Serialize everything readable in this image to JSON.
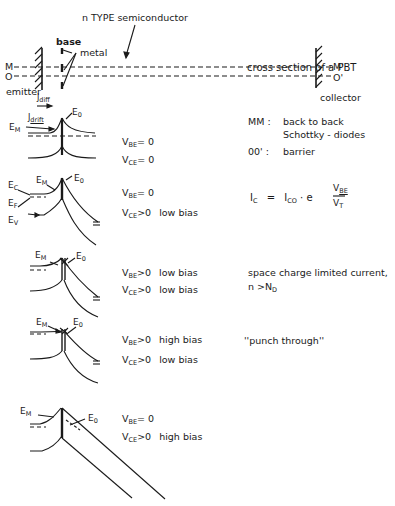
{
  "cross_section": {
    "n_type_label": "n TYPE  semiconductor",
    "base_label": "base",
    "metal_label": "metal",
    "M_label": "M",
    "O_label": "O",
    "M_prime_label": "M'",
    "O_prime_label": "O'",
    "emitter_label": "emitter",
    "collector_label": "collector",
    "j_diff_label": "J",
    "j_diff_sub": "diff",
    "j_drift_label": "J",
    "j_drift_sub": "drift",
    "caption": "cross section of a PBT"
  },
  "legend": {
    "mm_key": "MM  :",
    "mm_text_1": "back to back",
    "mm_text_2": "Schottky - diodes",
    "oo_key": "00' :",
    "oo_text": "barrier"
  },
  "equation": {
    "lhs": "I",
    "lhs_sub": "C",
    "equals": "=",
    "i0": "I",
    "i0_sub": "CO",
    "dot_e": "· e",
    "num": "V",
    "num_sub": "BE",
    "den": "V",
    "den_sub": "T"
  },
  "band_diagrams": [
    {
      "energy_labels": {
        "em": "E",
        "em_sub": "M",
        "eo": "E",
        "eo_sub": "0"
      },
      "conditions": [
        {
          "v": "V",
          "sub": "BE",
          "rel": "= 0",
          "bias": ""
        },
        {
          "v": "V",
          "sub": "CE",
          "rel": "= 0",
          "bias": ""
        }
      ],
      "note": ""
    },
    {
      "energy_labels": {
        "ec": "E",
        "ec_sub": "C",
        "ef": "E",
        "ef_sub": "F",
        "ev": "E",
        "ev_sub": "V",
        "em": "E",
        "em_sub": "M",
        "eo": "E",
        "eo_sub": "0"
      },
      "conditions": [
        {
          "v": "V",
          "sub": "BE",
          "rel": "= 0",
          "bias": ""
        },
        {
          "v": "V",
          "sub": "CE",
          "rel": ">0",
          "bias": "low bias"
        }
      ],
      "note": ""
    },
    {
      "energy_labels": {
        "em": "E",
        "em_sub": "M",
        "eo": "E",
        "eo_sub": "0"
      },
      "conditions": [
        {
          "v": "V",
          "sub": "BE",
          "rel": ">0",
          "bias": "low bias"
        },
        {
          "v": "V",
          "sub": "CE",
          "rel": ">0",
          "bias": "low bias"
        }
      ],
      "note": "space charge limited current,",
      "note2": "n >N",
      "note2_sub": "D"
    },
    {
      "energy_labels": {
        "em": "E",
        "em_sub": "M",
        "eo": "E",
        "eo_sub": "0"
      },
      "conditions": [
        {
          "v": "V",
          "sub": "BE",
          "rel": ">0",
          "bias": "high bias"
        },
        {
          "v": "V",
          "sub": "CE",
          "rel": ">0",
          "bias": "low bias"
        }
      ],
      "note": "''punch through''"
    },
    {
      "energy_labels": {
        "em": "E",
        "em_sub": "M",
        "eo": "E",
        "eo_sub": "0"
      },
      "conditions": [
        {
          "v": "V",
          "sub": "BE",
          "rel": "= 0",
          "bias": ""
        },
        {
          "v": "V",
          "sub": "CE",
          "rel": ">0",
          "bias": "high bias"
        }
      ],
      "note": ""
    }
  ]
}
